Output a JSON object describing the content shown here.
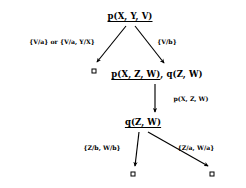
{
  "diagram": {
    "type": "sld-resolution-tree",
    "title": "",
    "nodes": [
      {
        "id": "root",
        "selected": "p(X, Y, V)",
        "rest": "",
        "x": 130,
        "y": 16,
        "name": "goal-node-root"
      },
      {
        "id": "mid",
        "selected": "p(X, Z, W)",
        "rest": ", q(Z, W)",
        "x": 157,
        "y": 74,
        "name": "goal-node-p-q"
      },
      {
        "id": "low",
        "selected": "q(Z, W)",
        "rest": "",
        "x": 143,
        "y": 122,
        "name": "goal-node-q"
      }
    ],
    "empty_clauses": [
      {
        "id": "box-left-top",
        "x": 94,
        "y": 71,
        "name": "empty-clause-box-1",
        "symbol": "box"
      },
      {
        "id": "box-bottom-left",
        "x": 133,
        "y": 174,
        "name": "empty-clause-box-2",
        "symbol": "box"
      },
      {
        "id": "box-bottom-right",
        "x": 212,
        "y": 174,
        "name": "empty-clause-box-3",
        "symbol": "box"
      }
    ],
    "edges": [
      {
        "id": "e1",
        "from": "root",
        "to": "box-left-top",
        "x1": 126,
        "y1": 26,
        "x2": 97,
        "y2": 62,
        "label": "{V/a} or {V/a, Y/X}",
        "label_x": 62,
        "label_y": 41,
        "name": "edge-root-to-empty"
      },
      {
        "id": "e2",
        "from": "root",
        "to": "mid",
        "x1": 135,
        "y1": 26,
        "x2": 164,
        "y2": 64,
        "label": "{V/b}",
        "label_x": 167,
        "label_y": 41,
        "name": "edge-root-to-p-q"
      },
      {
        "id": "e3",
        "from": "mid",
        "to": "low",
        "x1": 155,
        "y1": 84,
        "x2": 155,
        "y2": 112,
        "label": "p(X, Z, W)",
        "label_x": 191,
        "label_y": 98,
        "name": "edge-p-q-to-q"
      },
      {
        "id": "e4",
        "from": "low",
        "to": "box-bottom-left",
        "x1": 139,
        "y1": 132,
        "x2": 136,
        "y2": 165,
        "label": "{Z/b, W/b}",
        "label_x": 102,
        "label_y": 147,
        "name": "edge-q-to-empty-left"
      },
      {
        "id": "e5",
        "from": "low",
        "to": "box-bottom-right",
        "x1": 148,
        "y1": 132,
        "x2": 209,
        "y2": 165,
        "label": "{Z/a, W/a}",
        "label_x": 196,
        "label_y": 147,
        "name": "edge-q-to-empty-right"
      }
    ],
    "labels": {
      "e1": {
        "full": "{V/a} or {V/a, Y/X}",
        "underlined_parts": [
          "a",
          "a"
        ]
      },
      "e2": {
        "full": "{V/b}",
        "underlined_parts": [
          "b"
        ]
      },
      "e3": {
        "full": "p(X, Z, W)",
        "underlined_parts": []
      },
      "e4": {
        "full": "{Z/b, W/b}",
        "underlined_parts": [
          "Z",
          "b"
        ]
      },
      "e5": {
        "full": "{Z/a, W/a}",
        "underlined_parts": [
          "Z",
          "a"
        ]
      }
    },
    "colors": {
      "stroke": "#000000",
      "text": "#000000",
      "background": "#ffffff"
    }
  }
}
